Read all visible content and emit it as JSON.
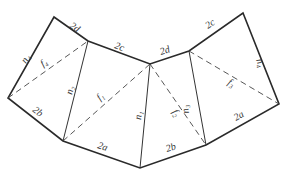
{
  "diagram": {
    "type": "net / triangulated polygon",
    "vertices": {
      "A": [
        54,
        17
      ],
      "B": [
        88,
        41
      ],
      "C": [
        150,
        64
      ],
      "D": [
        189,
        51
      ],
      "E": [
        243,
        13
      ],
      "F": [
        279,
        104
      ],
      "G": [
        206,
        145
      ],
      "H": [
        140,
        168
      ],
      "I": [
        63,
        141
      ],
      "J": [
        8,
        98
      ]
    },
    "outer_edges": [
      {
        "from": "J",
        "to": "A",
        "label": "n4"
      },
      {
        "from": "A",
        "to": "B",
        "label": "2d"
      },
      {
        "from": "B",
        "to": "C",
        "label": "2c"
      },
      {
        "from": "C",
        "to": "D",
        "label": "2d"
      },
      {
        "from": "D",
        "to": "E",
        "label": "2c"
      },
      {
        "from": "E",
        "to": "F",
        "label": "n4"
      },
      {
        "from": "F",
        "to": "G",
        "label": "2a"
      },
      {
        "from": "G",
        "to": "H",
        "label": "2b"
      },
      {
        "from": "H",
        "to": "I",
        "label": "2a"
      },
      {
        "from": "I",
        "to": "J",
        "label": "2b"
      }
    ],
    "inner_solid_edges": [
      {
        "from": "B",
        "to": "I",
        "label": "n2"
      },
      {
        "from": "C",
        "to": "H",
        "label": "n1"
      },
      {
        "from": "D",
        "to": "G",
        "label": "n3"
      }
    ],
    "dashed_edges": [
      {
        "from": "J",
        "to": "B",
        "label": "f4"
      },
      {
        "from": "I",
        "to": "C",
        "label": "f1"
      },
      {
        "from": "C",
        "to": "G",
        "label": "f2"
      },
      {
        "from": "D",
        "to": "F",
        "label": "f3"
      }
    ],
    "labels": {
      "n4_left": "n₄",
      "d_top_left": "2d",
      "c_top_left": "2c",
      "d_top_mid": "2d",
      "c_top_right": "2c",
      "n4_right": "n₄",
      "a_right": "2a",
      "b_bottom_right": "2b",
      "a_bottom_left": "2a",
      "b_left": "2b",
      "n2": "n₂",
      "n1": "n₁",
      "n3": "n₃",
      "f4": "f₄",
      "f1": "f₁",
      "f2": "f₂",
      "f3": "f₃"
    }
  }
}
